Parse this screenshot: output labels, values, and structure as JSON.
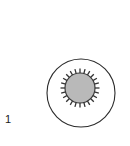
{
  "figure": {
    "panel_label": "1",
    "background_color": "#ffffff",
    "width": 130,
    "height": 146,
    "outer_circle": {
      "name": "outer boundary circle",
      "center_x": 81,
      "center_y": 93,
      "radius": 34,
      "fill": "none",
      "stroke_color": "#2b2b2b",
      "stroke_width": 1.1
    },
    "inner_structure": {
      "name": "spiked inner body",
      "center_x": 80,
      "center_y": 88,
      "body_radius": 15,
      "fill": "#b9b9b9",
      "stroke_color": "#3a3a3a",
      "stroke_width": 1.2,
      "spike_count": 24,
      "spike_length": 4.5,
      "spike_stroke_color": "#333333",
      "spike_stroke_width": 1.3
    }
  }
}
